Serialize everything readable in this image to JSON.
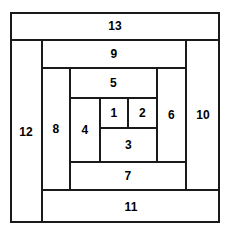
{
  "figure": {
    "canvas": {
      "width": 232,
      "height": 233
    },
    "background_color": "#ffffff",
    "line_color": "#1a1a1a",
    "label_color": "#000000",
    "outer_frame": {
      "x": 10,
      "y": 12,
      "width": 210,
      "height": 211
    }
  },
  "chart_data": {
    "type": "diagram",
    "xlabel": "",
    "ylabel": "",
    "pieces": [
      {
        "label": "1",
        "x": 100,
        "y": 98,
        "width": 28,
        "height": 30
      },
      {
        "label": "2",
        "x": 128,
        "y": 98,
        "width": 29,
        "height": 30
      },
      {
        "label": "3",
        "x": 100,
        "y": 128,
        "width": 57,
        "height": 34
      },
      {
        "label": "4",
        "x": 70,
        "y": 98,
        "width": 30,
        "height": 64
      },
      {
        "label": "5",
        "x": 70,
        "y": 68,
        "width": 87,
        "height": 30
      },
      {
        "label": "6",
        "x": 157,
        "y": 68,
        "width": 29,
        "height": 94
      },
      {
        "label": "7",
        "x": 70,
        "y": 162,
        "width": 116,
        "height": 28
      },
      {
        "label": "8",
        "x": 42,
        "y": 68,
        "width": 28,
        "height": 122
      },
      {
        "label": "9",
        "x": 42,
        "y": 40,
        "width": 144,
        "height": 28
      },
      {
        "label": "10",
        "x": 186,
        "y": 40,
        "width": 34,
        "height": 150
      },
      {
        "label": "11",
        "x": 42,
        "y": 190,
        "width": 178,
        "height": 33
      },
      {
        "label": "12",
        "x": 10,
        "y": 40,
        "width": 32,
        "height": 183
      },
      {
        "label": "13",
        "x": 10,
        "y": 12,
        "width": 210,
        "height": 28
      }
    ]
  }
}
